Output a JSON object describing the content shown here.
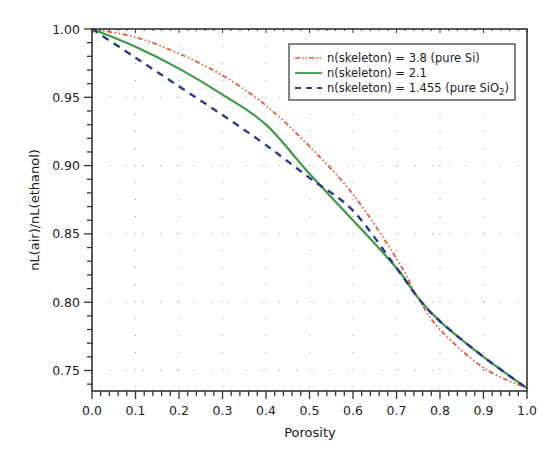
{
  "chart_data": {
    "type": "line",
    "title": "",
    "xlabel": "Porosity",
    "ylabel": "nL(air)/nL(ethanol)",
    "xlim": [
      0.0,
      1.0
    ],
    "ylim": [
      0.735,
      1.0
    ],
    "grid": "dotted",
    "legend_position": "upper right",
    "x_ticks": [
      "0.0",
      "0.1",
      "0.2",
      "0.3",
      "0.4",
      "0.5",
      "0.6",
      "0.7",
      "0.8",
      "0.9",
      "1.0"
    ],
    "y_ticks": [
      "0.75",
      "0.80",
      "0.85",
      "0.90",
      "0.95",
      "1.00"
    ],
    "x": [
      0.0,
      0.1,
      0.2,
      0.3,
      0.4,
      0.5,
      0.6,
      0.7,
      0.75,
      0.8,
      0.9,
      1.0
    ],
    "series": [
      {
        "name": "n(skeleton) = 3.8 (pure Si)",
        "color": "#e45a3c",
        "style": "dash-dot-dot",
        "values": [
          1.0,
          0.994,
          0.982,
          0.966,
          0.944,
          0.914,
          0.879,
          0.832,
          0.803,
          0.78,
          0.752,
          0.737
        ]
      },
      {
        "name": "n(skeleton) = 2.1",
        "color": "#3d9a44",
        "style": "solid",
        "values": [
          1.0,
          0.987,
          0.971,
          0.952,
          0.93,
          0.894,
          0.86,
          0.825,
          0.803,
          0.786,
          0.76,
          0.737
        ]
      },
      {
        "name": "n(skeleton) = 1.455 (pure SiO2)",
        "name_display": "n(skeleton) = 1.455 (pure SiO",
        "name_subscript": "2",
        "name_suffix": ")",
        "color": "#2e3b84",
        "style": "dashed",
        "values": [
          1.0,
          0.979,
          0.958,
          0.937,
          0.915,
          0.891,
          0.867,
          0.825,
          0.803,
          0.786,
          0.76,
          0.737
        ]
      }
    ]
  },
  "legend": {
    "items": [
      {
        "label": "n(skeleton) = 3.8 (pure Si)"
      },
      {
        "label": "n(skeleton) = 2.1"
      },
      {
        "label": "n(skeleton) = 1.455 (pure SiO",
        "sub": "2",
        "suffix": ")"
      }
    ]
  },
  "axes": {
    "xlabel": "Porosity",
    "ylabel": "nL(air)/nL(ethanol)"
  }
}
